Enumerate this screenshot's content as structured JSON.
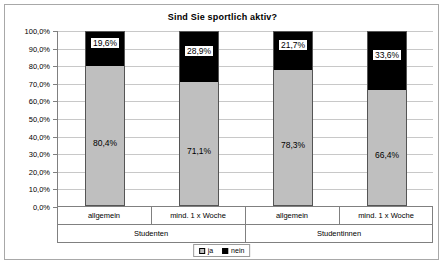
{
  "chart_data": {
    "type": "bar",
    "variant": "stacked-100-percent",
    "title": "Sind Sie sportlich aktiv?",
    "xlabel": "",
    "ylabel": "",
    "ylim": [
      0,
      100
    ],
    "grid": true,
    "legend_position": "bottom-center",
    "categories": [
      "allgemein",
      "mind. 1 x Woche",
      "allgemein",
      "mind. 1 x Woche"
    ],
    "groups": [
      {
        "label": "Studenten",
        "span": 2
      },
      {
        "label": "Studentinnen",
        "span": 2
      }
    ],
    "series": [
      {
        "name": "ja",
        "color": "#bfbfbf",
        "values": [
          80.4,
          71.1,
          78.3,
          66.4
        ],
        "labels": [
          "80,4%",
          "71,1%",
          "78,3%",
          "66,4%"
        ]
      },
      {
        "name": "nein",
        "color": "#000000",
        "values": [
          19.6,
          28.9,
          21.7,
          33.6
        ],
        "labels": [
          "19,6%",
          "28,9%",
          "21,7%",
          "33,6%"
        ]
      }
    ],
    "y_ticks": [
      {
        "value": 100,
        "label": "100,0%"
      },
      {
        "value": 90,
        "label": "90,0%"
      },
      {
        "value": 80,
        "label": "80,0%"
      },
      {
        "value": 70,
        "label": "70,0%"
      },
      {
        "value": 60,
        "label": "60,0%"
      },
      {
        "value": 50,
        "label": "50,0%"
      },
      {
        "value": 40,
        "label": "40,0%"
      },
      {
        "value": 30,
        "label": "30,0%"
      },
      {
        "value": 20,
        "label": "20,0%"
      },
      {
        "value": 10,
        "label": "10,0%"
      },
      {
        "value": 0,
        "label": "0,0%"
      }
    ],
    "legend": [
      {
        "label": "ja",
        "color": "#bfbfbf"
      },
      {
        "label": "nein",
        "color": "#000000"
      }
    ]
  }
}
